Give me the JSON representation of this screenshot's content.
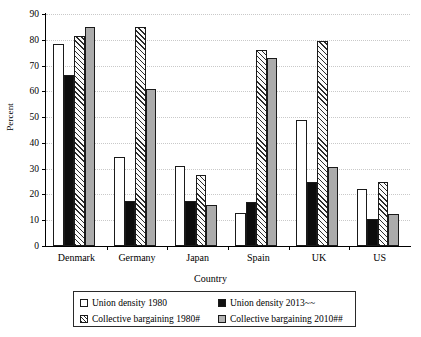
{
  "chart_data": {
    "type": "bar",
    "title": "",
    "xlabel": "Country",
    "ylabel": "Percent",
    "ylim": [
      0,
      90
    ],
    "ytick_labels": [
      "0",
      "10",
      "20",
      "30",
      "40",
      "50",
      "60",
      "70",
      "80",
      "90"
    ],
    "ytick_values": [
      0,
      10,
      20,
      30,
      40,
      50,
      60,
      70,
      80,
      90
    ],
    "grid": true,
    "legend_position": "below-plot",
    "categories": [
      "Denmark",
      "Germany",
      "Japan",
      "Spain",
      "UK",
      "US"
    ],
    "series": [
      {
        "name": "Union density 1980",
        "fill": "white",
        "values": [
          78.5,
          34.5,
          31.0,
          13.0,
          49.0,
          22.0
        ]
      },
      {
        "name": "Union density 2013~~",
        "fill": "black",
        "values": [
          66.5,
          17.5,
          17.5,
          17.0,
          25.0,
          10.5
        ]
      },
      {
        "name": "Collective bargaining 1980#",
        "fill": "hatched",
        "values": [
          81.5,
          85.0,
          27.5,
          76.0,
          79.5,
          25.0
        ]
      },
      {
        "name": "Collective bargaining 2010##",
        "fill": "gray",
        "values": [
          85.0,
          61.0,
          16.0,
          73.0,
          30.5,
          12.5
        ]
      }
    ]
  },
  "legend": {
    "items": [
      {
        "label": "Union density 1980"
      },
      {
        "label": "Union density 2013~~"
      },
      {
        "label": "Collective bargaining 1980#"
      },
      {
        "label": "Collective bargaining 2010##"
      }
    ]
  },
  "colors": {
    "series_white": "#ffffff",
    "series_black": "#0d0d0d",
    "series_hatched": "#2b2b2b",
    "series_gray": "#ababab",
    "gridline": "#c9c9c9",
    "axis": "#000000"
  }
}
